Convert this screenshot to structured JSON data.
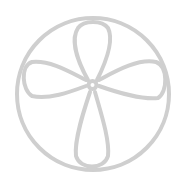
{
  "icon": {
    "name": "quatrefoil-in-circle-icon",
    "stroke_color": "#cfcfcf",
    "background": "#ffffff"
  }
}
